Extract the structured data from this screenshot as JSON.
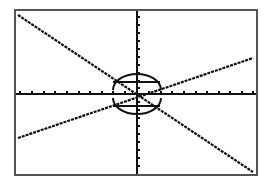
{
  "screen": {
    "background": "#ffffff",
    "frame_color": "#555555",
    "ink_color": "#111111"
  },
  "chart_data": {
    "type": "line",
    "title": "",
    "xlabel": "",
    "ylabel": "",
    "grid": false,
    "axes": {
      "x_ticks_visible": true,
      "y_ticks_visible": true,
      "tick_labels": false
    },
    "xlim": [
      -10,
      10
    ],
    "ylim": [
      -10,
      10
    ],
    "series": [
      {
        "name": "decreasing line",
        "x": [
          -10,
          10
        ],
        "y": [
          9.5,
          -9.5
        ]
      },
      {
        "name": "increasing line",
        "x": [
          -10,
          10
        ],
        "y": [
          -5.3,
          4.4
        ]
      },
      {
        "name": "ellipse (upper arc)",
        "shape": "ellipse-top",
        "center": [
          0,
          0
        ],
        "rx": 1.9,
        "ry": 1.9
      },
      {
        "name": "ellipse (lower arc)",
        "shape": "ellipse-bottom",
        "center": [
          0,
          0
        ],
        "rx": 1.9,
        "ry": 1.9
      }
    ]
  },
  "plot": {
    "frame": {
      "x": 15,
      "y": 10,
      "w": 242,
      "h": 165
    },
    "origin": {
      "x": 137,
      "y": 94
    },
    "x_ticks_px": [
      20,
      32,
      44,
      55,
      67,
      79,
      90,
      102,
      113,
      125,
      149,
      161,
      172,
      184,
      196,
      207,
      219,
      230,
      242,
      253
    ],
    "y_ticks_px": [
      17,
      25,
      33,
      41,
      49,
      57,
      65,
      73,
      81,
      88,
      102,
      110,
      118,
      126,
      134,
      142,
      150,
      158,
      166
    ],
    "line_decreasing": {
      "x1": 18,
      "y1": 15,
      "x2": 253,
      "y2": 172
    },
    "line_increasing": {
      "x1": 18,
      "y1": 138,
      "x2": 253,
      "y2": 58
    },
    "ellipse": {
      "cx": 137,
      "cy": 94,
      "rx": 24,
      "ry": 22
    },
    "center_bars": [
      {
        "x1": 113,
        "y1": 82,
        "x2": 160,
        "y2": 82
      },
      {
        "x1": 113,
        "y1": 106,
        "x2": 160,
        "y2": 106
      }
    ]
  }
}
